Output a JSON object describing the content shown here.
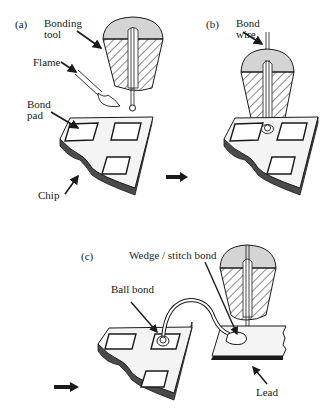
{
  "figure": {
    "panels": [
      {
        "id": "a",
        "label": "(a)",
        "annotations": {
          "bonding_tool": "Bonding\ntool",
          "flame": "Flame",
          "bond_pad": "Bond\npad",
          "chip": "Chip"
        }
      },
      {
        "id": "b",
        "label": "(b)",
        "annotations": {
          "bond_wire": "Bond\nwire"
        }
      },
      {
        "id": "c",
        "label": "(c)",
        "annotations": {
          "wedge_stitch_bond": "Wedge / stitch bond",
          "ball_bond": "Ball bond",
          "lead": "Lead"
        }
      }
    ],
    "flow_arrows": [
      "a-to-b",
      "b-to-c"
    ],
    "colors": {
      "ink": "#1a1a1a",
      "chip_side": "#4a4a4a",
      "chip_top": "#f4f4f4",
      "tool_cap": "#d4d4d4",
      "background": "#ffffff"
    }
  }
}
